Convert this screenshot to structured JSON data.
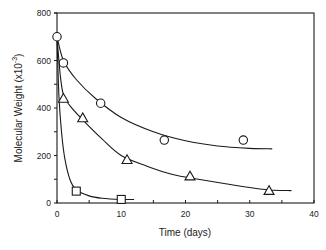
{
  "chart_data": {
    "type": "scatter",
    "title": "",
    "xlabel": "Time (days)",
    "ylabel": "Molecular Weight (x10",
    "ylabel_superscript": "-3",
    "ylabel_suffix": ")",
    "xlim": [
      0,
      40
    ],
    "ylim": [
      0,
      800
    ],
    "x_ticks": [
      0,
      10,
      20,
      30,
      40
    ],
    "x_minor_ticks": [
      5,
      15,
      25,
      35
    ],
    "y_ticks": [
      0,
      200,
      400,
      600,
      800
    ],
    "y_minor_ticks": [
      100,
      300,
      500,
      700
    ],
    "grid": false,
    "legend": null,
    "series": [
      {
        "name": "circles",
        "marker": "circle",
        "points": [
          [
            0,
            700
          ],
          [
            1,
            590
          ],
          [
            6.8,
            420
          ],
          [
            16.7,
            265
          ],
          [
            29,
            265
          ]
        ],
        "fit_curve": [
          [
            0,
            700
          ],
          [
            1,
            600
          ],
          [
            3,
            520
          ],
          [
            6,
            440
          ],
          [
            10,
            360
          ],
          [
            15,
            300
          ],
          [
            20,
            262
          ],
          [
            25,
            240
          ],
          [
            30,
            230
          ],
          [
            33.5,
            228
          ]
        ]
      },
      {
        "name": "triangles",
        "marker": "triangle",
        "points": [
          [
            1,
            440
          ],
          [
            4,
            358
          ],
          [
            10.9,
            182
          ],
          [
            20.7,
            113
          ],
          [
            33,
            52
          ]
        ],
        "fit_curve": [
          [
            0,
            700
          ],
          [
            0.5,
            540
          ],
          [
            1,
            455
          ],
          [
            2,
            410
          ],
          [
            4,
            350
          ],
          [
            7,
            270
          ],
          [
            10,
            200
          ],
          [
            14,
            155
          ],
          [
            18,
            120
          ],
          [
            22,
            100
          ],
          [
            26,
            82
          ],
          [
            30,
            65
          ],
          [
            33,
            55
          ],
          [
            36.5,
            52
          ]
        ]
      },
      {
        "name": "squares",
        "marker": "square",
        "points": [
          [
            3,
            50
          ],
          [
            10,
            15
          ]
        ],
        "fit_curve": [
          [
            0,
            700
          ],
          [
            0.3,
            450
          ],
          [
            0.7,
            300
          ],
          [
            1.2,
            190
          ],
          [
            2,
            100
          ],
          [
            3,
            55
          ],
          [
            5,
            30
          ],
          [
            7,
            20
          ],
          [
            10,
            15
          ],
          [
            12,
            15
          ]
        ]
      }
    ]
  }
}
